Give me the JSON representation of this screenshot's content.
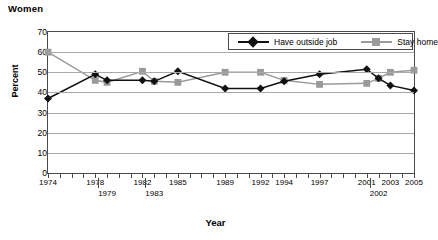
{
  "chart_data": {
    "type": "line",
    "title": "Women",
    "xlabel": "Year",
    "ylabel": "Percent",
    "ylim": [
      0,
      70
    ],
    "yticks": [
      0,
      10,
      20,
      30,
      40,
      50,
      60,
      70
    ],
    "xlim": [
      1974,
      2005
    ],
    "grid": true,
    "legend_position": "top-right",
    "x": [
      1974,
      1978,
      1979,
      1982,
      1983,
      1985,
      1989,
      1992,
      1994,
      1997,
      2001,
      2002,
      2003,
      2005
    ],
    "xtick_labels_row0": [
      "1974",
      "1978",
      "1982",
      "1985",
      "1989",
      "1992",
      "1994",
      "1997",
      "2001",
      "2003",
      "2005"
    ],
    "xtick_labels_row1": [
      "1979",
      "1983",
      "2002"
    ],
    "series": [
      {
        "name": "Have outside job",
        "color": "#111111",
        "marker": "diamond",
        "values": [
          37,
          49,
          46,
          46,
          45.5,
          50.5,
          42,
          42,
          45.5,
          49,
          51.5,
          47,
          43.5,
          41
        ]
      },
      {
        "name": "Stay home",
        "color": "#9a9a9a",
        "marker": "square",
        "values": [
          60,
          46,
          45,
          50.5,
          45.5,
          45,
          50,
          50,
          46,
          44,
          44.5,
          47,
          50,
          51
        ]
      }
    ]
  },
  "legend": {
    "items": [
      {
        "label": "Have outside job"
      },
      {
        "label": "Stay home"
      }
    ]
  }
}
